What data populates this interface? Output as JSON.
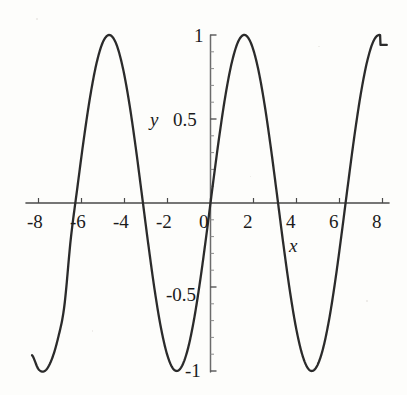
{
  "figure": {
    "background_color": "#fdfdfb",
    "curve_color": "#2b2b2b",
    "axis_color": "#4a4a4a",
    "text_color": "#1b1b1b"
  },
  "axis_labels": {
    "x": "x",
    "y": "y"
  },
  "x_tick_labels": [
    "-8",
    "-6",
    "-4",
    "-2",
    "0",
    "2",
    "4",
    "6",
    "8"
  ],
  "y_tick_labels": [
    "1",
    "0.5",
    "-0.5",
    "-1"
  ],
  "chart_data": {
    "type": "line",
    "title": "",
    "subtitle": "",
    "xlabel": "x",
    "ylabel": "y",
    "xlim": [
      -8.3,
      8.2
    ],
    "ylim": [
      -1.12,
      1.12
    ],
    "grid": false,
    "legend": null,
    "legend_position": "none",
    "x_ticks": [
      -8,
      -6,
      -4,
      -2,
      0,
      2,
      4,
      6,
      8
    ],
    "x_tick_labels": [
      "-8",
      "-6",
      "-4",
      "-2",
      "0",
      "2",
      "4",
      "6",
      "8"
    ],
    "y_ticks": [
      1,
      0.5,
      -0.5,
      -1
    ],
    "y_tick_labels": [
      "1",
      "0.5",
      "-0.5",
      "-1"
    ],
    "y_minor_ticks": [
      0.9,
      0.8,
      0.7,
      0.6,
      0.4,
      0.3,
      0.2,
      0.1,
      -0.1,
      -0.2,
      -0.3,
      -0.4,
      -0.6,
      -0.7,
      -0.8,
      -0.9
    ],
    "axes_style": "centered-cross",
    "annotations": [],
    "series": [
      {
        "name": "sin(x)",
        "function": "y = sin(x)",
        "period": 6.2832,
        "amplitude": 1,
        "zero_crossings": [
          -6.283,
          -3.142,
          0,
          3.142,
          6.283
        ],
        "maxima_x": [
          -4.712,
          1.571,
          7.854
        ],
        "minima_x": [
          -7.854,
          -1.571,
          4.712
        ],
        "x": [
          -8.3,
          -8.0,
          -7.7,
          -7.4,
          -7.1,
          -6.8,
          -6.5,
          -6.2,
          -5.9,
          -5.6,
          -5.3,
          -5.0,
          -4.7,
          -4.4,
          -4.1,
          -3.8,
          -3.5,
          -3.2,
          -2.9,
          -2.6,
          -2.3,
          -2.0,
          -1.7,
          -1.4,
          -1.1,
          -0.8,
          -0.5,
          -0.2,
          0.1,
          0.4,
          0.7,
          1.0,
          1.3,
          1.6,
          1.9,
          2.2,
          2.5,
          2.8,
          3.1,
          3.4,
          3.7,
          4.0,
          4.3,
          4.6,
          4.9,
          5.2,
          5.5,
          5.8,
          6.1,
          6.4,
          6.7,
          7.0,
          7.3,
          7.6,
          7.9,
          8.2
        ],
        "y": [
          -0.906,
          -0.989,
          -0.999,
          -0.936,
          -0.809,
          -0.615,
          -0.216,
          0.084,
          0.374,
          0.631,
          0.832,
          0.959,
          1.0,
          0.952,
          0.818,
          0.612,
          0.351,
          0.058,
          -0.239,
          -0.516,
          -0.746,
          -0.909,
          -0.992,
          -0.985,
          -0.891,
          -0.717,
          -0.479,
          -0.199,
          0.1,
          0.389,
          0.644,
          0.841,
          0.964,
          1.0,
          0.946,
          0.808,
          0.598,
          0.335,
          0.042,
          -0.256,
          -0.53,
          -0.757,
          -0.916,
          -0.994,
          -0.982,
          -0.883,
          -0.706,
          -0.465,
          -0.182,
          0.117,
          0.405,
          0.657,
          0.85,
          0.969,
          0.999,
          0.941
        ]
      }
    ]
  }
}
